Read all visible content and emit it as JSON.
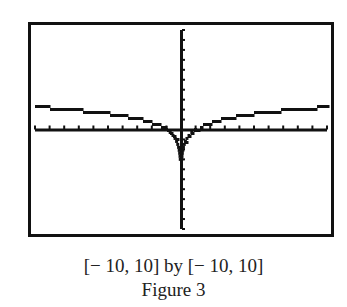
{
  "figure": {
    "window_label": "[− 10, 10] by [− 10, 10]",
    "caption": "Figure 3"
  },
  "colors": {
    "frame": "#111111",
    "curve": "#111111",
    "background": "#ffffff"
  },
  "chart_data": {
    "type": "line",
    "title": "Figure 3",
    "subtitle": "[-10, 10] by [-10, 10]",
    "function": "y = ln|x|",
    "xlabel": "",
    "ylabel": "",
    "xlim": [
      -10,
      10
    ],
    "ylim": [
      -10,
      10
    ],
    "xscale_tick": 1,
    "yscale_tick": 1,
    "grid": false,
    "legend": null,
    "x": [
      -10,
      -8,
      -6,
      -4,
      -2,
      -1,
      -0.5,
      -0.2,
      -0.1,
      0.1,
      0.2,
      0.5,
      1,
      2,
      4,
      6,
      8,
      10
    ],
    "y": [
      2.3,
      2.08,
      1.79,
      1.39,
      0.69,
      0,
      -0.69,
      -1.61,
      -2.3,
      -2.3,
      -1.61,
      -0.69,
      0,
      0.69,
      1.39,
      1.79,
      2.08,
      2.3
    ],
    "rendering": "pixelated calculator screen (stair-stepped line)"
  }
}
